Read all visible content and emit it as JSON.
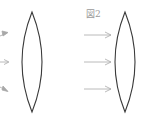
{
  "figure": {
    "label": "図2",
    "line_color": "#3a3a3a",
    "arrow_color": "#a8a8a8",
    "left_panel": {
      "lens": "convex-lens",
      "rays": "converging-rays (partially cropped)"
    },
    "right_panel": {
      "lens": "convex-lens",
      "rays": "parallel-rays",
      "ray_count": 3
    }
  }
}
